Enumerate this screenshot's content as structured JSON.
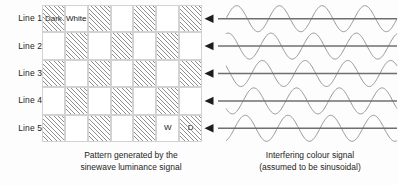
{
  "lines": [
    {
      "label": "Line 1"
    },
    {
      "label": "Line 2"
    },
    {
      "label": "Line 3"
    },
    {
      "label": "Line 4"
    },
    {
      "label": "Line 5"
    }
  ],
  "grid": {
    "columns": 7,
    "rows": 5,
    "legend_dark": "Dark",
    "legend_white": "White",
    "marker_white": "W",
    "marker_dark": "D",
    "pattern": [
      [
        "dark",
        "white",
        "dark",
        "white",
        "dark",
        "white",
        "dark"
      ],
      [
        "white",
        "dark",
        "white",
        "dark",
        "white",
        "dark",
        "white"
      ],
      [
        "dark",
        "white",
        "dark",
        "white",
        "dark",
        "white",
        "dark"
      ],
      [
        "white",
        "dark",
        "white",
        "dark",
        "white",
        "dark",
        "white"
      ],
      [
        "dark",
        "white",
        "dark",
        "white",
        "dark",
        "white",
        "dark"
      ]
    ]
  },
  "waves": {
    "count": 5,
    "cycles": 4,
    "phase_step_deg": 72,
    "arrow_direction": "left",
    "line_color": "#6f6f6f",
    "wave_color": "#8a8a8a"
  },
  "captions": {
    "left_line1": "Pattern generated by the",
    "left_line2": "sinewave luminance signal",
    "right_line1": "Interfering colour signal",
    "right_line2": "(assumed to be sinusoidal)"
  },
  "colors": {
    "background": "#fdfdfd",
    "text": "#1d1d1d",
    "hatch": "#8e8e8e",
    "cell_border": "#d2d2d2"
  }
}
